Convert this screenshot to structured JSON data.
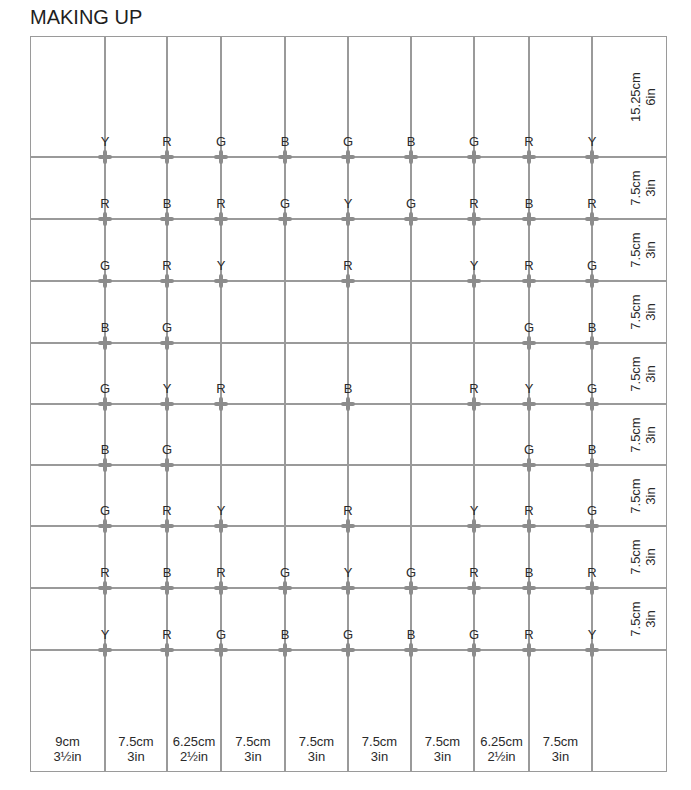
{
  "title": "MAKING UP",
  "colors": {
    "grid_line": "#9a9a9a",
    "cross": "#8c8c8c",
    "text": "#2a2a2a",
    "background": "#ffffff"
  },
  "legend": {
    "Y": "Yellow",
    "R": "Red",
    "G": "Green",
    "B": "Blue"
  },
  "grid": {
    "left": 30,
    "right": 667,
    "top": 36,
    "bottom": 772,
    "columns_x": [
      105,
      167,
      221,
      285,
      348,
      411,
      474,
      529,
      592
    ],
    "rows_y": [
      157,
      219,
      281,
      343,
      404,
      465,
      526,
      588,
      650
    ]
  },
  "column_dimensions": [
    {
      "cm": "9cm",
      "in": "3½in"
    },
    {
      "cm": "7.5cm",
      "in": "3in"
    },
    {
      "cm": "6.25cm",
      "in": "2½in"
    },
    {
      "cm": "7.5cm",
      "in": "3in"
    },
    {
      "cm": "7.5cm",
      "in": "3in"
    },
    {
      "cm": "7.5cm",
      "in": "3in"
    },
    {
      "cm": "7.5cm",
      "in": "3in"
    },
    {
      "cm": "6.25cm",
      "in": "2½in"
    },
    {
      "cm": "7.5cm",
      "in": "3in"
    }
  ],
  "row_dimensions": [
    {
      "cm": "15.25cm",
      "in": "6in"
    },
    {
      "cm": "7.5cm",
      "in": "3in"
    },
    {
      "cm": "7.5cm",
      "in": "3in"
    },
    {
      "cm": "7.5cm",
      "in": "3in"
    },
    {
      "cm": "7.5cm",
      "in": "3in"
    },
    {
      "cm": "7.5cm",
      "in": "3in"
    },
    {
      "cm": "7.5cm",
      "in": "3in"
    },
    {
      "cm": "7.5cm",
      "in": "3in"
    },
    {
      "cm": "7.5cm",
      "in": "3in"
    }
  ],
  "markers": [
    [
      "Y",
      "R",
      "G",
      "B",
      "G",
      "B",
      "G",
      "R",
      "Y"
    ],
    [
      "R",
      "B",
      "R",
      "G",
      "Y",
      "G",
      "R",
      "B",
      "R"
    ],
    [
      "G",
      "R",
      "Y",
      "",
      "R",
      "",
      "Y",
      "R",
      "G"
    ],
    [
      "B",
      "G",
      "",
      "",
      "",
      "",
      "",
      "G",
      "B"
    ],
    [
      "G",
      "Y",
      "R",
      "",
      "B",
      "",
      "R",
      "Y",
      "G"
    ],
    [
      "B",
      "G",
      "",
      "",
      "",
      "",
      "",
      "G",
      "B"
    ],
    [
      "G",
      "R",
      "Y",
      "",
      "R",
      "",
      "Y",
      "R",
      "G"
    ],
    [
      "R",
      "B",
      "R",
      "G",
      "Y",
      "G",
      "R",
      "B",
      "R"
    ],
    [
      "Y",
      "R",
      "G",
      "B",
      "G",
      "B",
      "G",
      "R",
      "Y"
    ]
  ]
}
